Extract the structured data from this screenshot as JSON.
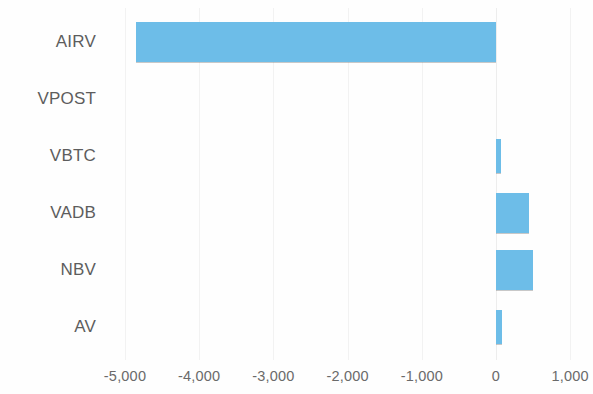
{
  "chart_data": {
    "type": "bar",
    "orientation": "horizontal",
    "title": "",
    "subtitle": "",
    "xlabel": "",
    "ylabel": "",
    "categories": [
      "AIRV",
      "VPOST",
      "VBTC",
      "VADB",
      "NBV",
      "AV"
    ],
    "values": [
      -4850,
      0,
      70,
      450,
      500,
      80
    ],
    "series": [
      {
        "name": "",
        "values": [
          -4850,
          0,
          70,
          450,
          500,
          80
        ]
      }
    ],
    "xlim": [
      -5500,
      1400
    ],
    "xticks": [
      -5000,
      -4000,
      -3000,
      -2000,
      -1000,
      0,
      1000
    ],
    "xtick_labels": [
      "-5,000",
      "-4,000",
      "-3,000",
      "-2,000",
      "-1,000",
      "0",
      "1,000"
    ],
    "grid": true,
    "grid_axis": "x",
    "legend": false,
    "legend_position": "none",
    "bar_color": "#6dbde8",
    "grid_color": "#f2f2f2",
    "text_color": "#5d5d5d",
    "background_color": "#ffffff"
  },
  "layout": {
    "zero_x_px": 496,
    "px_per_1000": 74.2,
    "row_height_px": 57,
    "first_row_top_px": 13,
    "bar_thickness_px": 40,
    "thin_bar_thickness_px": 34
  }
}
